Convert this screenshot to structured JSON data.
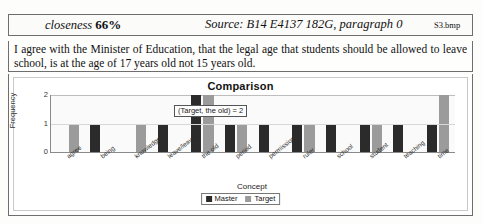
{
  "header": {
    "closeness_label": "closeness",
    "closeness_value": "66%",
    "source": "Source: B14 E4137 182G, paragraph 0",
    "filename": "S3.bmp"
  },
  "paragraph": {
    "text": "I agree with the Minister of Education, that the legal age that students should be allowed to leave school, is at the age of 17 years old not 15 years old."
  },
  "chart_data": {
    "type": "bar",
    "title": "Comparison",
    "xlabel": "Concept",
    "ylabel": "Frequency",
    "ylim": [
      0,
      2
    ],
    "yticks": [
      "0",
      "1",
      "2"
    ],
    "grid": true,
    "legend_position": "bottom",
    "annotation": "(Target, the old) = 2",
    "categories": [
      "agree",
      "being",
      "knowledge",
      "leave/leaves",
      "the old",
      "period",
      "permission",
      "ruler",
      "school",
      "student",
      "teaching",
      "time"
    ],
    "series": [
      {
        "name": "Master",
        "color": "#2b2b2b",
        "values": [
          0,
          1,
          0,
          1,
          2,
          1,
          1,
          1,
          1,
          1,
          1,
          1
        ]
      },
      {
        "name": "Target",
        "color": "#9b9b9b",
        "values": [
          1,
          0,
          1,
          0,
          2,
          1,
          0,
          1,
          0,
          1,
          0,
          2
        ]
      }
    ]
  }
}
